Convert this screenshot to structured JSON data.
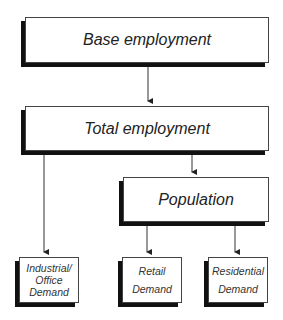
{
  "diagram": {
    "nodes": [
      {
        "id": "base",
        "label": "Base employment"
      },
      {
        "id": "total",
        "label": "Total employment"
      },
      {
        "id": "population",
        "label": "Population"
      },
      {
        "id": "industrial",
        "label_lines": [
          "Industrial/",
          "Office",
          "Demand"
        ]
      },
      {
        "id": "retail",
        "label_lines": [
          "Retail",
          "Demand"
        ]
      },
      {
        "id": "residential",
        "label_lines": [
          "Residential",
          "Demand"
        ]
      }
    ],
    "edges": [
      {
        "from": "base",
        "to": "total"
      },
      {
        "from": "total",
        "to": "industrial"
      },
      {
        "from": "total",
        "to": "population"
      },
      {
        "from": "population",
        "to": "retail"
      },
      {
        "from": "population",
        "to": "residential"
      }
    ]
  }
}
